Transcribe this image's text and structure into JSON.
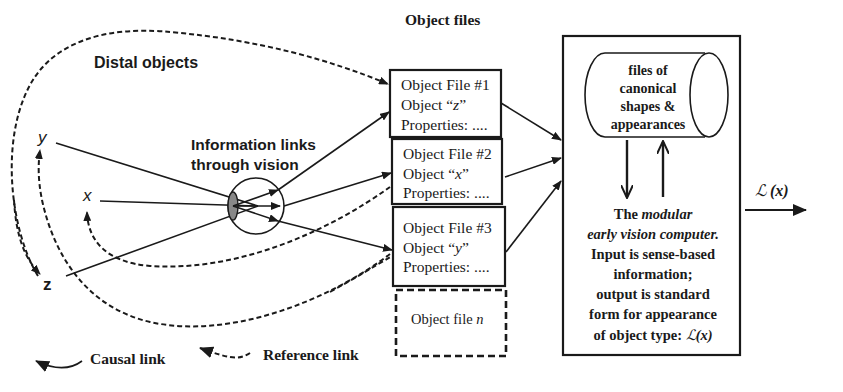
{
  "labels": {
    "distal_objects": "Distal objects",
    "info_links_line1": "Information links",
    "info_links_line2": "through vision",
    "object_files_title": "Object files",
    "var_y": "y",
    "var_x": "x",
    "var_z": "z"
  },
  "object_files": [
    {
      "title": "Object File #1",
      "object_prefix": "Object “",
      "object_var": "z",
      "object_suffix": "”",
      "properties": "Properties: ...."
    },
    {
      "title": "Object File #2",
      "object_prefix": "Object “",
      "object_var": "x",
      "object_suffix": "”",
      "properties": "Properties: ...."
    },
    {
      "title": "Object File #3",
      "object_prefix": "Object “",
      "object_var": "y",
      "object_suffix": "”",
      "properties": "Properties: ...."
    }
  ],
  "object_file_n": {
    "prefix": "Object file ",
    "var": "n"
  },
  "cylinder": {
    "lines": [
      "files of",
      "canonical",
      "shapes &",
      "appearances"
    ]
  },
  "computer": {
    "line1_prefix": "The ",
    "line1_italic": "modular",
    "line2_italic": "early vision computer.",
    "line3": "Input is sense-based",
    "line4": "information;",
    "line5": "output is standard",
    "line6": "form for appearance",
    "line7_prefix": "of object type: ",
    "line7_symbol": "ℒ",
    "line7_arg": "(x)"
  },
  "output": {
    "symbol": "ℒ",
    "arg": "(x)"
  },
  "legend": {
    "causal": "Causal link",
    "reference": "Reference link"
  },
  "colors": {
    "ink": "#1a1a1a",
    "background": "#ffffff"
  }
}
